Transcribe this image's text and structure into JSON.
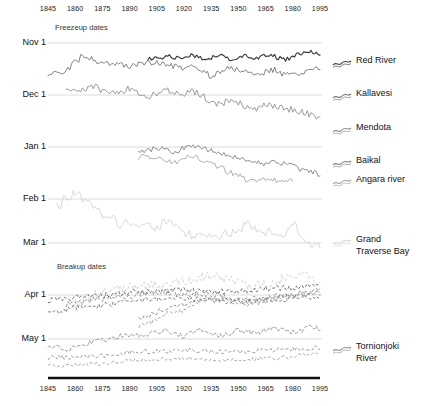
{
  "figure": {
    "section_labels": {
      "freezeup": "Freezeup dates",
      "breakup": "Breakup dates"
    },
    "colors": {
      "red_river": "#3a3a3a",
      "kallavesi": "#6e6e6e",
      "mendota": "#8a8a8a",
      "baikal": "#7a7a7a",
      "angara": "#a0a0a0",
      "grand_traverse_bay": "#d2d2d2",
      "tornionjoki": "#8f8f8f",
      "gridline": "#d8d8d8",
      "axis": "#111111",
      "text": "#111111"
    }
  },
  "chart_data": {
    "type": "line",
    "title": "",
    "subtitle": "",
    "xlabel": "",
    "ylabel": "",
    "xlim": [
      1845,
      1995
    ],
    "ylim_labels": [
      "Nov 1",
      "Dec 1",
      "Jan 1",
      "Feb 1",
      "Mar 1",
      "Apr 1",
      "May 1"
    ],
    "grid": true,
    "legend_position": "right",
    "x_ticks": [
      1845,
      1860,
      1875,
      1890,
      1905,
      1920,
      1935,
      1950,
      1965,
      1980,
      1995
    ],
    "x_tick_labels": [
      "1845",
      "1860",
      "1875",
      "1890",
      "1905",
      "1920",
      "1935",
      "1950",
      "1965",
      "1980",
      "1995"
    ],
    "y_ticks": [
      "Nov 1",
      "Dec 1",
      "Jan 1",
      "Feb 1",
      "Mar 1",
      "Apr 1",
      "May 1"
    ],
    "axis_top_labels": [
      "1845",
      "1860",
      "1875",
      "1890",
      "1905",
      "1920",
      "1935",
      "1950",
      "1965",
      "1980",
      "1995"
    ],
    "axis_bottom_labels": [
      "1845",
      "1860",
      "1875",
      "1890",
      "1905",
      "1920",
      "1935",
      "1950",
      "1965",
      "1980",
      "1995"
    ],
    "groups": [
      {
        "name": "Freezeup dates",
        "series": [
          "Red River",
          "Kallavesi",
          "Mendota",
          "Baikal",
          "Angara river",
          "Grand Traverse Bay"
        ]
      },
      {
        "name": "Breakup dates",
        "series": [
          "Tornionjoki River",
          "Red River",
          "Kallavesi",
          "Mendota",
          "Baikal",
          "Angara river",
          "Grand Traverse Bay"
        ]
      }
    ],
    "series": [
      {
        "name": "Red River",
        "color": "#3a3a3a",
        "style": "solid",
        "group": "freezeup",
        "x": [
          1900,
          1903,
          1906,
          1909,
          1912,
          1915,
          1918,
          1921,
          1924,
          1927,
          1930,
          1933,
          1936,
          1939,
          1942,
          1945,
          1948,
          1951,
          1954,
          1957,
          1960,
          1963,
          1966,
          1969,
          1972,
          1975,
          1978,
          1981,
          1984,
          1987,
          1990,
          1993,
          1995
        ],
        "values": [
          60,
          58,
          59,
          57,
          56,
          58,
          59,
          57,
          55,
          56,
          58,
          60,
          57,
          55,
          57,
          59,
          58,
          56,
          55,
          57,
          58,
          56,
          54,
          56,
          58,
          60,
          58,
          56,
          54,
          53,
          52,
          54,
          55
        ]
      },
      {
        "name": "Kallavesi",
        "color": "#6e6e6e",
        "style": "solid",
        "group": "freezeup",
        "x": [
          1845,
          1850,
          1855,
          1860,
          1865,
          1870,
          1875,
          1880,
          1885,
          1890,
          1895,
          1900,
          1905,
          1910,
          1915,
          1920,
          1925,
          1930,
          1935,
          1940,
          1945,
          1950,
          1955,
          1960,
          1965,
          1970,
          1975,
          1980,
          1985,
          1990,
          1995
        ],
        "values": [
          74,
          73,
          71,
          62,
          55,
          60,
          62,
          63,
          64,
          66,
          64,
          63,
          62,
          64,
          66,
          68,
          66,
          70,
          76,
          72,
          68,
          70,
          72,
          74,
          72,
          70,
          74,
          76,
          72,
          70,
          68
        ]
      },
      {
        "name": "Mendota",
        "color": "#8a8a8a",
        "style": "solid",
        "group": "freezeup",
        "x": [
          1855,
          1860,
          1865,
          1870,
          1875,
          1880,
          1885,
          1890,
          1895,
          1900,
          1905,
          1910,
          1915,
          1920,
          1925,
          1930,
          1935,
          1940,
          1945,
          1950,
          1955,
          1960,
          1965,
          1970,
          1975,
          1980,
          1985,
          1990,
          1995
        ],
        "values": [
          92,
          90,
          88,
          86,
          90,
          92,
          94,
          88,
          92,
          96,
          94,
          90,
          92,
          94,
          92,
          96,
          102,
          104,
          100,
          104,
          106,
          108,
          104,
          106,
          108,
          110,
          112,
          114,
          118
        ]
      },
      {
        "name": "Baikal",
        "color": "#7a7a7a",
        "style": "solid",
        "group": "freezeup",
        "x": [
          1895,
          1900,
          1905,
          1910,
          1915,
          1920,
          1925,
          1930,
          1935,
          1940,
          1945,
          1950,
          1955,
          1960,
          1965,
          1970,
          1975,
          1980,
          1985,
          1990,
          1995
        ],
        "values": [
          152,
          150,
          148,
          150,
          152,
          148,
          146,
          148,
          150,
          154,
          156,
          158,
          160,
          162,
          164,
          162,
          164,
          166,
          170,
          172,
          174
        ]
      },
      {
        "name": "Angara river",
        "color": "#a0a0a0",
        "style": "solid",
        "group": "freezeup",
        "x": [
          1895,
          1900,
          1905,
          1910,
          1915,
          1920,
          1925,
          1930,
          1935,
          1940,
          1945,
          1950,
          1955,
          1960,
          1965,
          1970,
          1975,
          1980
        ],
        "values": [
          158,
          156,
          158,
          160,
          162,
          158,
          156,
          160,
          164,
          168,
          172,
          176,
          180,
          182,
          178,
          180,
          182,
          180
        ]
      },
      {
        "name": "Grand Traverse Bay",
        "color": "#d2d2d2",
        "style": "solid",
        "group": "freezeup",
        "x": [
          1850,
          1855,
          1860,
          1865,
          1870,
          1875,
          1880,
          1885,
          1890,
          1895,
          1900,
          1905,
          1910,
          1915,
          1920,
          1925,
          1930,
          1935,
          1940,
          1945,
          1950,
          1955,
          1960,
          1965,
          1970,
          1975,
          1980,
          1985,
          1990,
          1995
        ],
        "values": [
          208,
          198,
          192,
          200,
          206,
          214,
          218,
          224,
          222,
          224,
          226,
          228,
          220,
          224,
          232,
          236,
          234,
          238,
          236,
          232,
          230,
          224,
          228,
          232,
          230,
          236,
          222,
          238,
          244,
          246
        ]
      },
      {
        "name": "Tornionjoki River",
        "color": "#8f8f8f",
        "style": "dashed",
        "group": "breakup",
        "x": [
          1845,
          1850,
          1855,
          1860,
          1865,
          1870,
          1875,
          1880,
          1885,
          1890,
          1895,
          1900,
          1905,
          1910,
          1915,
          1920,
          1925,
          1930,
          1935,
          1940,
          1945,
          1950,
          1955,
          1960,
          1965,
          1970,
          1975,
          1980,
          1985,
          1990,
          1995
        ],
        "values": [
          348,
          346,
          350,
          348,
          344,
          342,
          340,
          338,
          336,
          334,
          336,
          334,
          332,
          330,
          334,
          336,
          332,
          330,
          334,
          336,
          334,
          330,
          332,
          334,
          330,
          328,
          330,
          332,
          330,
          326,
          328
        ]
      }
    ],
    "annotations": [
      {
        "text": "Freezeup dates",
        "x": 1860,
        "y": "above Nov 1"
      },
      {
        "text": "Breakup dates",
        "x": 1862,
        "y": "below Mar 1"
      }
    ]
  },
  "legend": {
    "items": [
      {
        "label": "Red River",
        "color": "#3a3a3a"
      },
      {
        "label": "Kallavesi",
        "color": "#6e6e6e"
      },
      {
        "label": "Mendota",
        "color": "#8a8a8a"
      },
      {
        "label": "Baikal",
        "color": "#7a7a7a"
      },
      {
        "label": "Angara river",
        "color": "#a0a0a0"
      },
      {
        "label": "Grand\nTraverse Bay",
        "color": "#d2d2d2"
      },
      {
        "label": "Tornionjoki\nRiver",
        "color": "#8f8f8f"
      }
    ]
  }
}
